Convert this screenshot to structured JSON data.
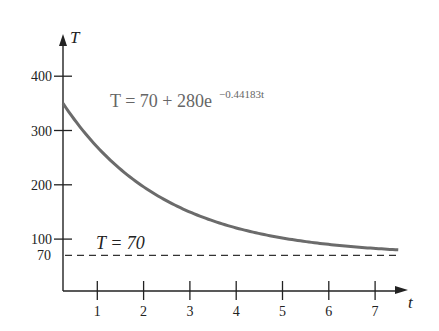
{
  "chart_data": {
    "type": "line",
    "title": "",
    "xlabel": "t",
    "ylabel": "T",
    "x_ticks": [
      1,
      2,
      3,
      4,
      5,
      6,
      7
    ],
    "y_ticks": [
      70,
      100,
      200,
      300,
      400
    ],
    "xlim": [
      0,
      7.5
    ],
    "ylim": [
      0,
      430
    ],
    "grid": false,
    "series": [
      {
        "name": "T = 70 + 280e^(-0.44183t)",
        "style": "solid",
        "color": "#6b6b6b",
        "x": [
          0,
          0.5,
          1,
          1.5,
          2,
          2.5,
          3,
          3.5,
          4,
          4.5,
          5,
          5.5,
          6,
          6.5,
          7,
          7.5
        ],
        "values": [
          350,
          295.1,
          250.0,
          214.9,
          188.9,
          169.8,
          144.9,
          130.8,
          117.4,
          107.3,
          101.5,
          94.5,
          89.8,
          86.0,
          82.7,
          80.2
        ]
      },
      {
        "name": "T = 70",
        "style": "dashed",
        "color": "#333333",
        "x": [
          0,
          7.5
        ],
        "values": [
          70,
          70
        ]
      }
    ],
    "annotations": [
      {
        "text": "T = 70 + 280e",
        "superscript": "−0.44183t",
        "position": "upper-middle"
      },
      {
        "text": "T = 70",
        "position": "above dashed asymptote"
      }
    ]
  },
  "labels": {
    "y_axis": "T",
    "x_axis": "t",
    "equation_main": "T = 70 + 280e",
    "equation_exp": "−0.44183t",
    "asymptote": "T = 70",
    "y_tick_labels": [
      "400",
      "300",
      "200",
      "100",
      "70"
    ],
    "x_tick_labels": [
      "1",
      "2",
      "3",
      "4",
      "5",
      "6",
      "7"
    ]
  }
}
